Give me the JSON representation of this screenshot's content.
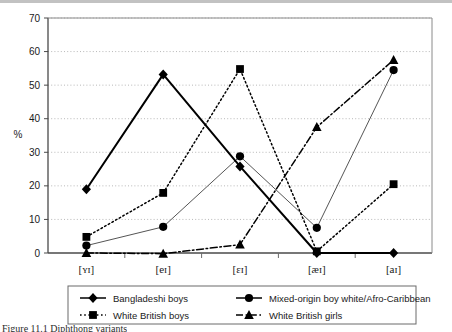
{
  "figure": {
    "caption_clipped": "Figure 11.1  Diphthong variants"
  },
  "chart_data": {
    "type": "line",
    "title": "",
    "xlabel": "",
    "ylabel": "%",
    "ylim": [
      0,
      70
    ],
    "ytick_step": 10,
    "yticks": [
      "0",
      "10",
      "20",
      "30",
      "40",
      "50",
      "60",
      "70"
    ],
    "grid": true,
    "grid_style": "dotted-horizontal",
    "legend_position": "bottom",
    "categories": [
      "[ʏɪ]",
      "[eɪ]",
      "[ɛɪ]",
      "[æɪ]",
      "[aɪ]"
    ],
    "series": [
      {
        "name": "Bangladeshi boys",
        "marker": "diamond",
        "line_style": "solid",
        "line_width": 2,
        "color": "#000000",
        "values": [
          19,
          53.2,
          25.8,
          0,
          0
        ]
      },
      {
        "name": "Mixed-origin boy white/Afro-Caribbean",
        "marker": "circle",
        "line_style": "solid",
        "line_width": 1,
        "color": "#555555",
        "values": [
          2.2,
          7.8,
          28.8,
          7.5,
          54.5
        ]
      },
      {
        "name": "White British boys",
        "marker": "square",
        "line_style": "dotted",
        "line_width": 1.5,
        "color": "#000000",
        "values": [
          4.8,
          17.9,
          54.8,
          0.5,
          20.5
        ]
      },
      {
        "name": "White British girls",
        "marker": "triangle",
        "line_style": "dash-dot",
        "line_width": 1.5,
        "color": "#000000",
        "values": [
          0,
          -0.2,
          2.5,
          37.5,
          57.5
        ]
      }
    ]
  },
  "legend": {
    "items": [
      {
        "label": "Bangladeshi boys",
        "marker": "diamond",
        "line_style": "solid"
      },
      {
        "label": "Mixed-origin boy white/Afro-Caribbean",
        "marker": "circle",
        "line_style": "solid"
      },
      {
        "label": "White British boys",
        "marker": "square",
        "line_style": "dotted"
      },
      {
        "label": "White British girls",
        "marker": "triangle",
        "line_style": "dash-dot"
      }
    ]
  }
}
